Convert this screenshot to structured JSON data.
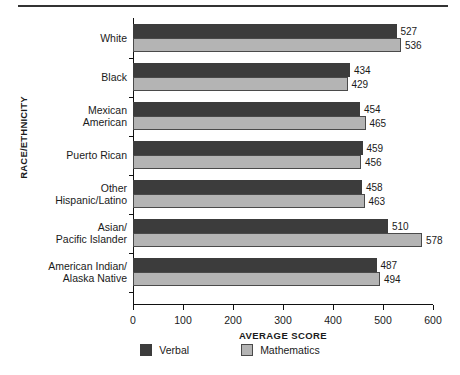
{
  "chart_data": {
    "type": "bar",
    "orientation": "horizontal",
    "title": "",
    "xlabel": "AVERAGE SCORE",
    "ylabel": "RACE/ETHNICITY",
    "xlim": [
      0,
      600
    ],
    "xticks": [
      0,
      100,
      200,
      300,
      400,
      500,
      600
    ],
    "grid": false,
    "legend_position": "bottom",
    "categories": [
      "White",
      "Black",
      "Mexican\nAmerican",
      "Puerto Rican",
      "Other\nHispanic/Latino",
      "Asian/\nPacific Islander",
      "American Indian/\nAlaska Native"
    ],
    "series": [
      {
        "name": "Verbal",
        "color": "#3c3c3c",
        "values": [
          527,
          434,
          454,
          459,
          458,
          510,
          487
        ]
      },
      {
        "name": "Mathematics",
        "color": "#b4b4b4",
        "values": [
          536,
          429,
          465,
          456,
          463,
          578,
          494
        ]
      }
    ]
  },
  "axis": {
    "x_title": "AVERAGE SCORE",
    "y_title": "RACE/ETHNICITY",
    "x_tick_labels": [
      "0",
      "100",
      "200",
      "300",
      "400",
      "500",
      "600"
    ]
  },
  "categories": [
    {
      "lines": [
        "White"
      ]
    },
    {
      "lines": [
        "Black"
      ]
    },
    {
      "lines": [
        "Mexican",
        "American"
      ]
    },
    {
      "lines": [
        "Puerto Rican"
      ]
    },
    {
      "lines": [
        "Other",
        "Hispanic/Latino"
      ]
    },
    {
      "lines": [
        "Asian/",
        "Pacific Islander"
      ]
    },
    {
      "lines": [
        "American Indian/",
        "Alaska Native"
      ]
    }
  ],
  "bars": [
    {
      "verbal": "527",
      "math": "536"
    },
    {
      "verbal": "434",
      "math": "429"
    },
    {
      "verbal": "454",
      "math": "465"
    },
    {
      "verbal": "459",
      "math": "456"
    },
    {
      "verbal": "458",
      "math": "463"
    },
    {
      "verbal": "510",
      "math": "578"
    },
    {
      "verbal": "487",
      "math": "494"
    }
  ],
  "legend": {
    "items": [
      {
        "label": "Verbal",
        "color": "#3c3c3c"
      },
      {
        "label": "Mathematics",
        "color": "#b4b4b4"
      }
    ]
  }
}
